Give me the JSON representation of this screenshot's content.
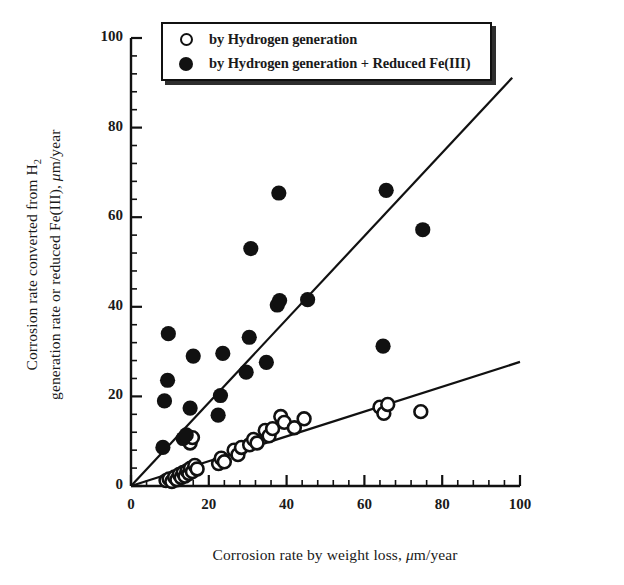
{
  "figure": {
    "background": "#ffffff",
    "ink": "#111111"
  },
  "axes": {
    "x": {
      "label_parts": {
        "pre": "Corrosion rate by weight loss, ",
        "mu": "μ",
        "post": "m/year"
      },
      "label": "Corrosion rate by weight loss, μm/year",
      "ticks": [
        "0",
        "20",
        "40",
        "60",
        "80",
        "100"
      ],
      "tick_values": [
        0,
        20,
        40,
        60,
        80,
        100
      ],
      "minor_per_major": 4,
      "range": [
        0,
        100
      ]
    },
    "y": {
      "label_line1_parts": {
        "pre": "Corrosion rate converted from H",
        "sub": "2"
      },
      "label_line2_parts": {
        "pre": "generation rate or reduced Fe(III), ",
        "mu": "μ",
        "post": "m/year"
      },
      "label": "Corrosion rate converted from H2 generation rate or reduced Fe(III), μm/year",
      "ticks": [
        "0",
        "20",
        "40",
        "60",
        "80",
        "100"
      ],
      "tick_values": [
        0,
        20,
        40,
        60,
        80,
        100
      ],
      "minor_per_major": 4,
      "range": [
        0,
        100
      ]
    }
  },
  "legend": {
    "position": "top",
    "entries": [
      {
        "marker": "open-circle-marker",
        "label": "by Hydrogen generation"
      },
      {
        "marker": "filled-circle-marker",
        "label": "by Hydrogen generation + Reduced Fe(III)"
      }
    ]
  },
  "chart_data": {
    "type": "scatter",
    "title": "",
    "xlabel": "Corrosion rate by weight loss, μm/year",
    "ylabel": "Corrosion rate converted from H2 generation rate or reduced Fe(III), μm/year",
    "xlim": [
      0,
      100
    ],
    "ylim": [
      0,
      100
    ],
    "grid": false,
    "legend_position": "top",
    "series": [
      {
        "name": "by Hydrogen generation",
        "marker": "open-circle",
        "color": "#111111",
        "fill": "#ffffff",
        "points": [
          [
            9.0,
            1.2
          ],
          [
            9.8,
            1.6
          ],
          [
            10.5,
            1.0
          ],
          [
            11.2,
            2.0
          ],
          [
            11.8,
            1.4
          ],
          [
            12.4,
            2.6
          ],
          [
            12.9,
            1.9
          ],
          [
            13.4,
            3.0
          ],
          [
            13.9,
            2.2
          ],
          [
            14.4,
            3.4
          ],
          [
            14.9,
            2.8
          ],
          [
            15.3,
            4.0
          ],
          [
            15.8,
            3.2
          ],
          [
            16.4,
            4.6
          ],
          [
            17.0,
            3.8
          ],
          [
            14.2,
            10.6
          ],
          [
            15.2,
            9.6
          ],
          [
            15.8,
            10.8
          ],
          [
            22.5,
            5.0
          ],
          [
            23.2,
            6.2
          ],
          [
            24.0,
            5.4
          ],
          [
            26.5,
            8.0
          ],
          [
            27.5,
            7.0
          ],
          [
            28.4,
            8.6
          ],
          [
            30.5,
            9.2
          ],
          [
            31.5,
            10.4
          ],
          [
            32.4,
            9.6
          ],
          [
            34.5,
            12.4
          ],
          [
            35.5,
            11.2
          ],
          [
            36.4,
            12.8
          ],
          [
            38.5,
            15.5
          ],
          [
            39.4,
            14.2
          ],
          [
            42.0,
            13.0
          ],
          [
            44.5,
            15.0
          ],
          [
            64.0,
            17.6
          ],
          [
            65.0,
            16.2
          ],
          [
            66.0,
            18.2
          ],
          [
            74.5,
            16.6
          ]
        ]
      },
      {
        "name": "by Hydrogen generation + Reduced Fe(III)",
        "marker": "filled-circle",
        "color": "#111111",
        "points": [
          [
            8.2,
            8.6
          ],
          [
            8.6,
            19.0
          ],
          [
            9.4,
            23.6
          ],
          [
            9.6,
            34.0
          ],
          [
            13.4,
            10.6
          ],
          [
            14.2,
            11.4
          ],
          [
            15.2,
            17.4
          ],
          [
            16.0,
            29.0
          ],
          [
            22.4,
            15.8
          ],
          [
            23.0,
            20.2
          ],
          [
            23.6,
            29.6
          ],
          [
            29.6,
            25.4
          ],
          [
            30.4,
            33.2
          ],
          [
            30.8,
            53.0
          ],
          [
            34.8,
            27.6
          ],
          [
            37.6,
            40.4
          ],
          [
            38.2,
            41.4
          ],
          [
            38.0,
            65.4
          ],
          [
            45.4,
            41.6
          ],
          [
            64.8,
            31.2
          ],
          [
            65.6,
            66.0
          ],
          [
            75.0,
            57.2
          ]
        ]
      }
    ],
    "fit_lines": [
      {
        "name": "fit-filled-series",
        "slope": 0.93,
        "intercept": 0.0,
        "x_from": 0,
        "x_to": 98
      },
      {
        "name": "fit-open-series",
        "slope": 0.277,
        "intercept": 0.0,
        "x_from": 0,
        "x_to": 100
      }
    ]
  }
}
